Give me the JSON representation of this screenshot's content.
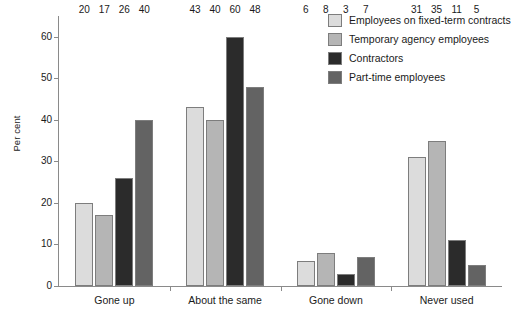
{
  "chart_data": {
    "type": "bar",
    "title": "",
    "xlabel": "",
    "ylabel": "Per cent",
    "ylim": [
      0,
      65
    ],
    "yticks": [
      0,
      10,
      20,
      30,
      40,
      50,
      60
    ],
    "grid": false,
    "legend_position": "top-right",
    "data_labels": true,
    "categories": [
      "Gone up",
      "About the same",
      "Gone down",
      "Never used"
    ],
    "series": [
      {
        "name": "Employees on fixed-term contracts",
        "color": "#dcdcdc",
        "values": [
          20,
          43,
          6,
          31
        ]
      },
      {
        "name": "Temporary agency employees",
        "color": "#b5b5b5",
        "values": [
          17,
          40,
          8,
          35
        ]
      },
      {
        "name": "Contractors",
        "color": "#2b2b2b",
        "values": [
          26,
          60,
          3,
          11
        ]
      },
      {
        "name": "Part-time employees",
        "color": "#636363",
        "values": [
          40,
          48,
          7,
          5
        ]
      }
    ]
  }
}
